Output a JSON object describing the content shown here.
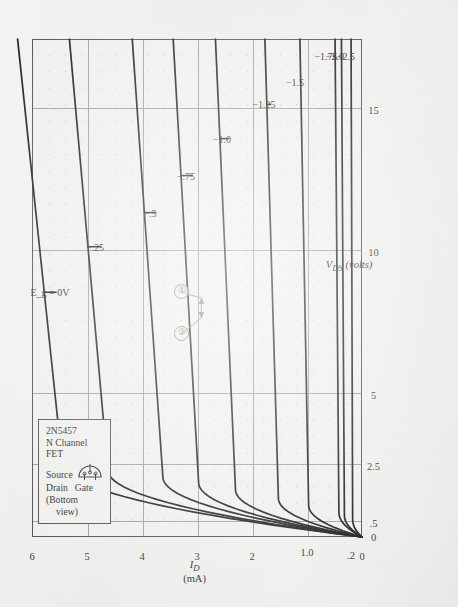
{
  "chart_data": {
    "type": "line",
    "xlabel": "V_DS (volts)",
    "ylabel": "I_D (mA)",
    "xlim": [
      0,
      17.5
    ],
    "ylim": [
      0,
      6
    ],
    "grid": true,
    "legend_position": "inside-top-left",
    "xticks": [
      {
        "value": 0,
        "label": "0"
      },
      {
        "value": 0.5,
        "label": ".5"
      },
      {
        "value": 2.5,
        "label": "2.5"
      },
      {
        "value": 5,
        "label": "5"
      },
      {
        "value": 10,
        "label": "10"
      },
      {
        "value": 15,
        "label": "15"
      }
    ],
    "yticks": [
      {
        "value": 0,
        "label": "0"
      },
      {
        "value": 0.2,
        "label": ".2"
      },
      {
        "value": 1.0,
        "label": "1.0"
      },
      {
        "value": 2,
        "label": "2"
      },
      {
        "value": 3,
        "label": "3"
      },
      {
        "value": 4,
        "label": "4"
      },
      {
        "value": 5,
        "label": "5"
      },
      {
        "value": 6,
        "label": "6"
      }
    ],
    "series": [
      {
        "name": "E_g = 0V",
        "label": "E_g = 0V",
        "idss": 5.45,
        "vp": 2.6,
        "label_x": 8.6,
        "label_y": 5.68
      },
      {
        "name": "-.25",
        "label": "−.25",
        "idss": 4.62,
        "vp": 2.35,
        "label_x": 10.2,
        "label_y": 4.86
      },
      {
        "name": "-.5",
        "label": "−.5",
        "idss": 3.62,
        "vp": 2.1,
        "label_x": 11.4,
        "label_y": 3.86
      },
      {
        "name": "-.75",
        "label": "−.75",
        "idss": 2.97,
        "vp": 1.9,
        "label_x": 12.7,
        "label_y": 3.2
      },
      {
        "name": "-1.0",
        "label": "−1.0",
        "idss": 2.3,
        "vp": 1.65,
        "label_x": 14.0,
        "label_y": 2.54
      },
      {
        "name": "-1.25",
        "label": "−1.25",
        "idss": 1.52,
        "vp": 1.35,
        "label_x": 15.2,
        "label_y": 1.78
      },
      {
        "name": "-1.5",
        "label": "−1.5",
        "idss": 0.97,
        "vp": 1.1,
        "label_x": 16.0,
        "label_y": 1.22
      },
      {
        "name": "-1.75",
        "label": "−1.75",
        "idss": 0.42,
        "vp": 0.85,
        "label_x": 16.9,
        "label_y": 0.66
      },
      {
        "name": "-2.0",
        "label": "−2.0",
        "idss": 0.32,
        "vp": 0.75,
        "label_x": 16.9,
        "label_y": 0.5
      },
      {
        "name": "-2.5",
        "label": "−2.5",
        "idss": 0.17,
        "vp": 0.6,
        "label_x": 16.9,
        "label_y": 0.3
      }
    ],
    "annotations": [
      {
        "id": "2",
        "label": "②",
        "x": 7.1,
        "y": 3.3,
        "arrow_to_x": 7.7,
        "arrow_to_y": 2.92
      },
      {
        "id": "1",
        "label": "①",
        "x": 8.6,
        "y": 3.3,
        "arrow_to_x": 8.4,
        "arrow_to_y": 2.92
      }
    ]
  },
  "legend": {
    "part_number": "2N5457",
    "channel": "N Channel",
    "device": "FET",
    "pin_source": "Source",
    "pin_drain": "Drain",
    "pin_gate": "Gate",
    "view_line1": "(Bottom",
    "view_line2": "view)"
  },
  "axes": {
    "x_title_sub": "DS",
    "x_title_main": "V",
    "x_title_units": "(volts)",
    "y_title_main": "I",
    "y_title_sub": "D",
    "y_title_units": "(mA)"
  },
  "colors": {
    "paper": "#eeeeec",
    "frame": "#4a4a4a",
    "grid": "#9a9a9a",
    "dots": "#b9b4ae",
    "curve": "#121212",
    "annotation": "#8d8d8d"
  }
}
